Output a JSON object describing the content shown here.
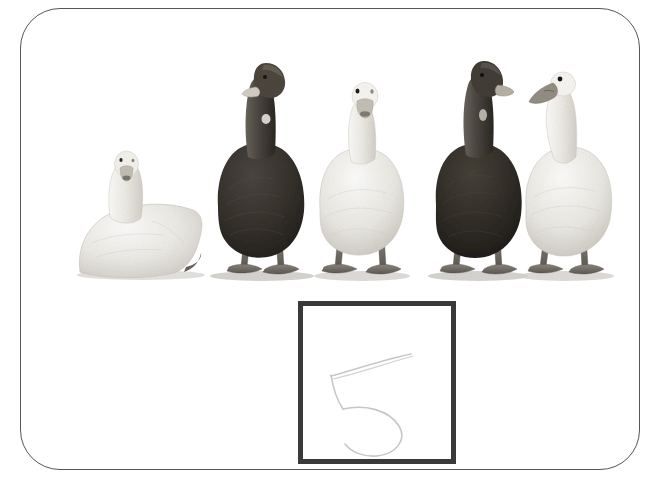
{
  "worksheet": {
    "title": "Counting worksheet card",
    "frame_color": "#565656",
    "background_color": "#ffffff"
  },
  "photo": {
    "name": "row-of-ducks-photograph",
    "description": "Black and white photograph of five ducks standing in a row on a plain white background",
    "subject_count": 5,
    "ground_line_y": 265,
    "subjects": [
      {
        "index": 1,
        "label": "white duck sitting",
        "pose": "sitting",
        "facing": "front",
        "plumage": "white",
        "bill_color": "#b9b4aa",
        "body_color": "#e6e4df",
        "x": 60,
        "width": 130,
        "height": 110
      },
      {
        "index": 2,
        "label": "dark duck standing",
        "pose": "standing",
        "facing": "front",
        "plumage": "dark",
        "bill_color": "#cfcabf",
        "body_color": "#3b3833",
        "x": 188,
        "width": 105,
        "height": 235
      },
      {
        "index": 3,
        "label": "white duck standing",
        "pose": "standing",
        "facing": "front",
        "plumage": "white",
        "bill_color": "#b5b0a6",
        "body_color": "#e9e7e2",
        "x": 292,
        "width": 100,
        "height": 200
      },
      {
        "index": 4,
        "label": "dark duck standing",
        "pose": "standing",
        "facing": "front",
        "plumage": "dark",
        "bill_color": "#b0aba0",
        "body_color": "#332f2b",
        "x": 404,
        "width": 102,
        "height": 220
      },
      {
        "index": 5,
        "label": "white duck in profile",
        "pose": "standing",
        "facing": "left",
        "plumage": "white",
        "bill_color": "#9b968c",
        "body_color": "#e4e2dc",
        "x": 498,
        "width": 105,
        "height": 205
      }
    ]
  },
  "answer_box": {
    "name": "answer-box",
    "border_color": "#3a3a3a",
    "border_width_px": 5,
    "fill_color": "#ffffff",
    "handwriting": {
      "glyph": "5",
      "style": "faint pencil",
      "stroke_color": "#c9c7c4"
    }
  }
}
